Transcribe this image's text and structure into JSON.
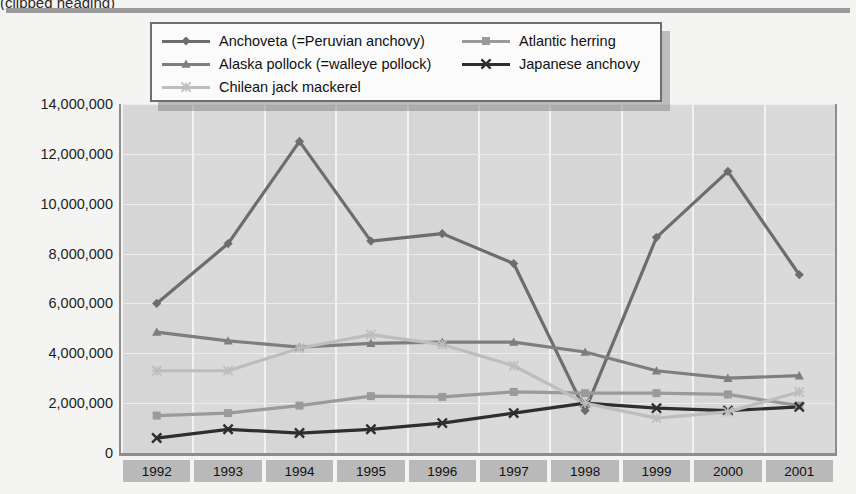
{
  "top_title": "(clipped heading)",
  "chart_data": {
    "type": "line",
    "title": "",
    "subtitle": "",
    "xlabel": "",
    "ylabel": "",
    "categories": [
      "1992",
      "1993",
      "1994",
      "1995",
      "1996",
      "1997",
      "1998",
      "1999",
      "2000",
      "2001"
    ],
    "x": [
      1992,
      1993,
      1994,
      1995,
      1996,
      1997,
      1998,
      1999,
      2000,
      2001
    ],
    "ylim": [
      0,
      14000000
    ],
    "ytick_values": [
      0,
      2000000,
      4000000,
      6000000,
      8000000,
      10000000,
      12000000,
      14000000
    ],
    "ytick_labels": [
      "0",
      "2,000,000",
      "4,000,000",
      "6,000,000",
      "8,000,000",
      "10,000,000",
      "12,000,000",
      "14,000,000"
    ],
    "grid": true,
    "legend_position": "top-center",
    "series": [
      {
        "name": "Anchoveta (=Peruvian anchovy)",
        "marker": "diamond",
        "color": "#6d6d6d",
        "values": [
          6000000,
          8400000,
          12500000,
          8500000,
          8800000,
          7600000,
          1700000,
          8650000,
          11300000,
          7150000
        ]
      },
      {
        "name": "Atlantic herring",
        "marker": "square",
        "color": "#9a9a9a",
        "values": [
          1500000,
          1600000,
          1900000,
          2280000,
          2250000,
          2450000,
          2400000,
          2400000,
          2350000,
          1900000
        ]
      },
      {
        "name": "Alaska pollock (=walleye pollock)",
        "marker": "triangle",
        "color": "#7e7e7e",
        "values": [
          4850000,
          4500000,
          4250000,
          4400000,
          4450000,
          4450000,
          4050000,
          3300000,
          3000000,
          3100000
        ]
      },
      {
        "name": "Japanese anchovy",
        "marker": "x",
        "color": "#2e2e2e",
        "values": [
          600000,
          950000,
          800000,
          950000,
          1200000,
          1600000,
          2000000,
          1800000,
          1700000,
          1850000
        ]
      },
      {
        "name": "Chilean jack mackerel",
        "marker": "asterisk",
        "color": "#bdbdbd",
        "values": [
          3300000,
          3300000,
          4200000,
          4750000,
          4350000,
          3500000,
          2000000,
          1400000,
          1650000,
          2450000
        ]
      }
    ]
  },
  "legend": {
    "items": [
      {
        "label": "Anchoveta (=Peruvian anchovy)",
        "marker": "diamond",
        "color": "#6d6d6d"
      },
      {
        "label": "Atlantic herring",
        "marker": "square",
        "color": "#9a9a9a"
      },
      {
        "label": "Alaska pollock (=walleye pollock)",
        "marker": "triangle",
        "color": "#7e7e7e"
      },
      {
        "label": "Japanese anchovy",
        "marker": "x",
        "color": "#2e2e2e"
      },
      {
        "label": "Chilean jack mackerel",
        "marker": "asterisk",
        "color": "#bdbdbd"
      }
    ]
  }
}
